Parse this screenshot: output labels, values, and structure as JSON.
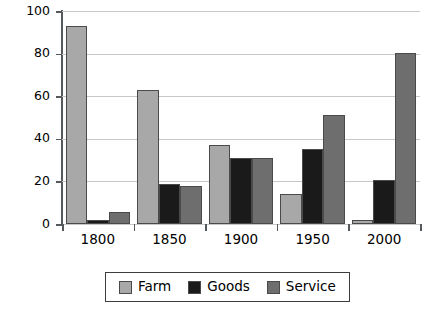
{
  "chart_data": {
    "type": "bar",
    "title": "",
    "subtitle": "",
    "xlabel": "",
    "ylabel": "Percent",
    "categories": [
      "1800",
      "1850",
      "1900",
      "1950",
      "2000"
    ],
    "series": [
      {
        "name": "Farm",
        "color": "#a8a8a8",
        "values": [
          93,
          63,
          37,
          14,
          2
        ]
      },
      {
        "name": "Goods",
        "color": "#1a1a1a",
        "values": [
          2,
          19,
          31,
          35,
          20.5
        ]
      },
      {
        "name": "Service",
        "color": "#6e6e6e",
        "values": [
          5.5,
          18,
          31,
          51,
          80.5
        ]
      }
    ],
    "ylim": [
      0,
      100
    ],
    "yticks": [
      0,
      20,
      40,
      60,
      80,
      100
    ],
    "ytick_labels": [
      "0",
      "20",
      "40",
      "60",
      "80",
      "100"
    ],
    "grid": true,
    "grid_axis": "y",
    "legend_position": "bottom",
    "annotations": []
  },
  "legend": {
    "entries": [
      {
        "label": "Farm"
      },
      {
        "label": "Goods"
      },
      {
        "label": "Service"
      }
    ]
  },
  "colors": {
    "farm": "#a8a8a8",
    "goods": "#1a1a1a",
    "service": "#6e6e6e",
    "axis": "#55595c",
    "grid": "#c8c8c8",
    "background": "#ffffff",
    "text": "#000000"
  }
}
